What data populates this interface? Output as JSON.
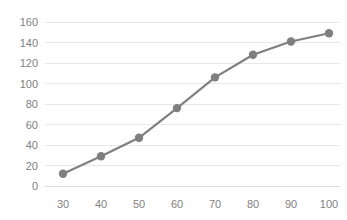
{
  "chart_data": {
    "type": "line",
    "title": "",
    "subtitle": "",
    "xlabel": "",
    "ylabel": "",
    "x": [
      30,
      40,
      50,
      60,
      70,
      80,
      90,
      100
    ],
    "values": [
      12,
      29,
      47,
      76,
      106,
      128,
      141,
      149
    ],
    "series": [
      {
        "name": "",
        "x": [
          30,
          40,
          50,
          60,
          70,
          80,
          90,
          100
        ],
        "values": [
          12,
          29,
          47,
          76,
          106,
          128,
          141,
          149
        ]
      }
    ],
    "xlim": [
      25,
      105
    ],
    "ylim": [
      0,
      160
    ],
    "x_ticks": [
      30,
      40,
      50,
      60,
      70,
      80,
      90,
      100
    ],
    "y_ticks": [
      0,
      20,
      40,
      60,
      80,
      100,
      120,
      140,
      160
    ],
    "x_tick_labels": [
      "30",
      "40",
      "50",
      "60",
      "70",
      "80",
      "90",
      "100"
    ],
    "y_tick_labels": [
      "0",
      "20",
      "40",
      "60",
      "80",
      "100",
      "120",
      "140",
      "160"
    ],
    "grid": {
      "horizontal": true,
      "vertical": false,
      "color": "#e8e8e8"
    },
    "legend": {
      "visible": false,
      "position": "none",
      "entries": []
    },
    "marker": {
      "shape": "circle",
      "size": 4.2
    },
    "colors": {
      "line": "#7f7f7f",
      "marker": "#7f7f7f",
      "grid": "#e8e8e8",
      "tick_label": "#808080",
      "background": "#ffffff"
    }
  },
  "axes": {
    "y_labels": [
      "160",
      "140",
      "120",
      "100",
      "80",
      "60",
      "40",
      "20",
      "0"
    ],
    "x_labels": [
      "30",
      "40",
      "50",
      "60",
      "70",
      "80",
      "90",
      "100"
    ]
  }
}
